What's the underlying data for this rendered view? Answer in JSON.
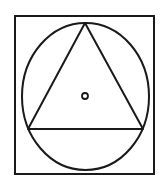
{
  "diagram": {
    "stroke_color": "#1a1a1a",
    "background": "#ffffff",
    "square": {
      "x": 15,
      "y": 16,
      "width": 139,
      "height": 158
    },
    "ellipse": {
      "cx": 85.5,
      "cy": 96.5,
      "rx": 63.5,
      "ry": 73.5
    },
    "triangle": {
      "points": "85,23 28,129 143,129"
    },
    "center_dot": {
      "cx": 85,
      "cy": 96,
      "r": 3
    }
  }
}
